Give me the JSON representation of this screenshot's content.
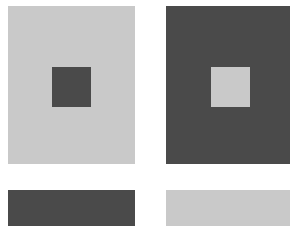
{
  "figure": {
    "colors": {
      "light": "#c9c9c9",
      "dark": "#4a4a4a",
      "background": "#ffffff"
    },
    "panels": [
      {
        "name": "left",
        "background": "light",
        "inner_square": "dark"
      },
      {
        "name": "right",
        "background": "dark",
        "inner_square": "light"
      }
    ],
    "bars": [
      {
        "name": "left",
        "color": "dark"
      },
      {
        "name": "right",
        "color": "light"
      }
    ]
  }
}
